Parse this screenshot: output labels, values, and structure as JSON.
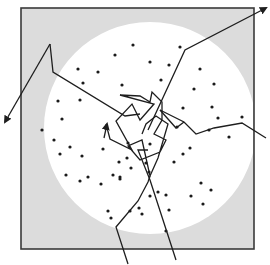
{
  "diagram": {
    "colors": {
      "background": "#ffffff",
      "outer_region": "#dcdcdc",
      "inner_disk": "#ffffff",
      "border": "#3a3a3a",
      "path": "#1e1e1e",
      "scatterer": "#1a1a1a"
    },
    "square": {
      "x": 21,
      "y": 8,
      "width": 233,
      "height": 241
    },
    "disk": {
      "cx": 150,
      "cy": 128,
      "r": 106
    },
    "scatterers": [
      [
        133,
        45
      ],
      [
        115,
        55
      ],
      [
        180,
        47
      ],
      [
        150,
        62
      ],
      [
        169,
        65
      ],
      [
        200,
        69
      ],
      [
        98,
        72
      ],
      [
        78,
        69
      ],
      [
        122,
        85
      ],
      [
        161,
        80
      ],
      [
        83,
        83
      ],
      [
        194,
        89
      ],
      [
        214,
        84
      ],
      [
        212,
        107
      ],
      [
        58,
        101
      ],
      [
        80,
        100
      ],
      [
        183,
        108
      ],
      [
        218,
        118
      ],
      [
        242,
        117
      ],
      [
        177,
        127
      ],
      [
        209,
        130
      ],
      [
        229,
        137
      ],
      [
        62,
        119
      ],
      [
        54,
        140
      ],
      [
        42,
        130
      ],
      [
        70,
        147
      ],
      [
        60,
        154
      ],
      [
        103,
        149
      ],
      [
        82,
        156
      ],
      [
        128,
        143
      ],
      [
        66,
        175
      ],
      [
        113,
        175
      ],
      [
        119,
        162
      ],
      [
        120,
        177
      ],
      [
        101,
        184
      ],
      [
        150,
        144
      ],
      [
        80,
        181
      ],
      [
        190,
        148
      ],
      [
        127,
        158
      ],
      [
        183,
        154
      ],
      [
        146,
        163
      ],
      [
        166,
        195
      ],
      [
        149,
        172
      ],
      [
        120,
        179
      ],
      [
        191,
        196
      ],
      [
        203,
        204
      ],
      [
        150,
        196
      ],
      [
        174,
        162
      ],
      [
        88,
        177
      ],
      [
        108,
        211
      ],
      [
        130,
        211
      ],
      [
        139,
        208
      ],
      [
        169,
        210
      ],
      [
        158,
        192
      ],
      [
        131,
        168
      ],
      [
        201,
        183
      ],
      [
        211,
        190
      ],
      [
        142,
        214
      ],
      [
        111,
        218
      ],
      [
        166,
        231
      ]
    ],
    "paths": [
      {
        "name": "path-exit-top-left",
        "points": [
          [
            50,
            44
          ],
          [
            53,
            72
          ],
          [
            125,
            116
          ],
          [
            140,
            114
          ]
        ],
        "arrow_end": [
          [
            50,
            44
          ],
          [
            5,
            122
          ]
        ]
      },
      {
        "name": "path-exit-top-right",
        "points": [
          [
            148,
            130
          ],
          [
            185,
            50
          ],
          [
            266,
            8
          ]
        ]
      },
      {
        "name": "path-exit-right",
        "points": [
          [
            160,
            110
          ],
          [
            184,
            122
          ],
          [
            196,
            134
          ],
          [
            214,
            128
          ],
          [
            242,
            123
          ],
          [
            266,
            138
          ]
        ],
        "pre": [
          [
            184,
            122
          ],
          [
            176,
            128
          ],
          [
            160,
            110
          ]
        ]
      },
      {
        "name": "path-entry-bottom-left",
        "points": [
          [
            128,
            264
          ],
          [
            116,
            227
          ],
          [
            138,
            201
          ],
          [
            148,
            182
          ],
          [
            150,
            176
          ]
        ]
      },
      {
        "name": "path-entry-bottom-right",
        "points": [
          [
            176,
            260
          ],
          [
            150,
            180
          ],
          [
            138,
            150
          ],
          [
            148,
            150
          ]
        ]
      },
      {
        "name": "tangle",
        "points": [
          [
            106,
            124
          ],
          [
            110,
            139
          ],
          [
            132,
            150
          ],
          [
            116,
            121
          ],
          [
            132,
            104
          ],
          [
            140,
            120
          ],
          [
            154,
            104
          ],
          [
            120,
            95
          ],
          [
            140,
            96
          ],
          [
            150,
            102
          ],
          [
            152,
            92
          ],
          [
            162,
            102
          ],
          [
            162,
            120
          ],
          [
            154,
            134
          ],
          [
            166,
            140
          ],
          [
            160,
            152
          ],
          [
            140,
            160
          ],
          [
            128,
            146
          ],
          [
            142,
            140
          ],
          [
            150,
            176
          ],
          [
            158,
            158
          ],
          [
            168,
            124
          ],
          [
            156,
            116
          ],
          [
            146,
            124
          ],
          [
            142,
            134
          ]
        ]
      }
    ],
    "entry_arrow": {
      "at": [
        107,
        124
      ],
      "direction": "up"
    }
  }
}
